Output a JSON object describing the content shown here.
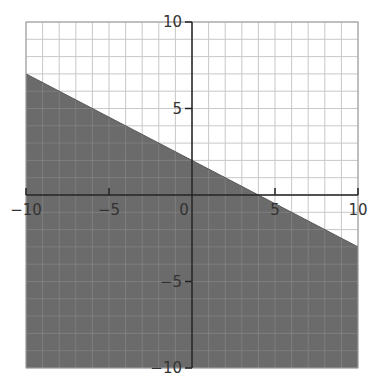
{
  "chart_data": {
    "type": "area",
    "title": "",
    "xlabel": "",
    "ylabel": "",
    "xlim": [
      -10,
      10
    ],
    "ylim": [
      -10,
      10
    ],
    "grid": true,
    "grid_step": 1,
    "x_ticks": [
      -10,
      -5,
      0,
      5,
      10
    ],
    "y_ticks": [
      -10,
      -5,
      5,
      10
    ],
    "x_tick_labels": [
      "−10",
      "−5",
      "0",
      "5",
      "10"
    ],
    "y_tick_labels": [
      "−10",
      "−5",
      "5",
      "10"
    ],
    "boundary_line": {
      "equation": "y = -0.5x + 2",
      "slope": -0.5,
      "intercept": 2,
      "points": [
        [
          -10,
          7
        ],
        [
          10,
          -3
        ]
      ],
      "style": "solid"
    },
    "shaded_region": "below",
    "inequality": "y <= -0.5x + 2",
    "colors": {
      "shade": "#6b6b6b",
      "grid": "#c8c8c8",
      "grid_on_shade": "#8a8a8a",
      "axis": "#222222",
      "frame": "#9a9a9a"
    }
  }
}
